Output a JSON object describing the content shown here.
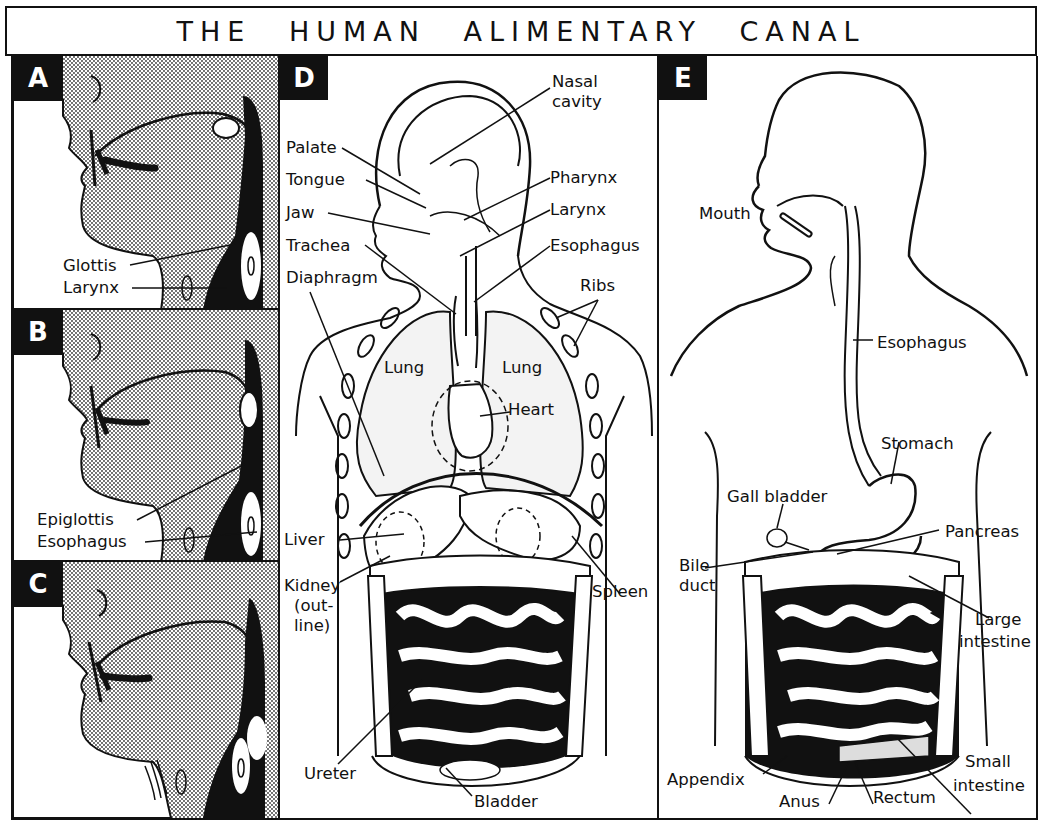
{
  "title": "THE HUMAN ALIMENTARY CANAL",
  "colors": {
    "ink": "#111111",
    "paper": "#ffffff",
    "stipple": "#cfcfcf"
  },
  "panels": {
    "a": {
      "letter": "A",
      "labels": {
        "glottis": "Glottis",
        "larynx": "Larynx"
      }
    },
    "b": {
      "letter": "B",
      "labels": {
        "epiglottis": "Epiglottis",
        "esophagus": "Esophagus"
      }
    },
    "c": {
      "letter": "C",
      "labels": {}
    },
    "d": {
      "letter": "D",
      "labels": {
        "nasal_cavity_1": "Nasal",
        "nasal_cavity_2": "cavity",
        "palate": "Palate",
        "tongue": "Tongue",
        "jaw": "Jaw",
        "trachea": "Trachea",
        "diaphragm": "Diaphragm",
        "pharynx": "Pharynx",
        "larynx": "Larynx",
        "esophagus": "Esophagus",
        "ribs": "Ribs",
        "lung_left": "Lung",
        "lung_right": "Lung",
        "heart": "Heart",
        "liver": "Liver",
        "kidney_1": "Kidney",
        "kidney_2": "(out-",
        "kidney_3": "line)",
        "spleen": "Spleen",
        "ureter": "Ureter",
        "bladder": "Bladder"
      }
    },
    "e": {
      "letter": "E",
      "labels": {
        "mouth": "Mouth",
        "esophagus": "Esophagus",
        "stomach": "Stomach",
        "gall_bladder": "Gall bladder",
        "pancreas": "Pancreas",
        "bile_duct_1": "Bile",
        "bile_duct_2": "duct",
        "large_intestine_1": "Large",
        "large_intestine_2": "intestine",
        "small_intestine_1": "Small",
        "small_intestine_2": "intestine",
        "appendix": "Appendix",
        "anus": "Anus",
        "rectum": "Rectum"
      }
    }
  }
}
